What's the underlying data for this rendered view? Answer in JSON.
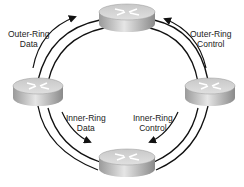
{
  "diagram": {
    "nodes": [
      {
        "id": "top",
        "icon": "router-icon"
      },
      {
        "id": "left",
        "icon": "router-icon"
      },
      {
        "id": "right",
        "icon": "router-icon"
      },
      {
        "id": "bottom",
        "icon": "router-icon"
      }
    ],
    "labels": {
      "outer_data": {
        "line1": "Outer-Ring",
        "line2": "Data"
      },
      "outer_control": {
        "line1": "Outer-Ring",
        "line2": "Control"
      },
      "inner_data": {
        "line1": "Inner-Ring",
        "line2": "Data"
      },
      "inner_control": {
        "line1": "Inner-Ring",
        "line2": "Control"
      }
    },
    "rings": [
      "outer-ring",
      "inner-ring"
    ],
    "colors": {
      "line": "#111111",
      "router_top": "#d8d8d8",
      "router_side": "#a8a8a8"
    }
  }
}
